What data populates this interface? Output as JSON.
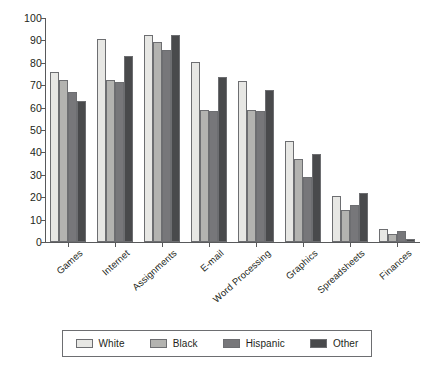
{
  "chart_data": {
    "type": "bar",
    "title": "",
    "subtitle": "",
    "xlabel": "",
    "ylabel": "",
    "ylim": [
      0,
      100
    ],
    "ytick_step": 10,
    "yticks": [
      0,
      10,
      20,
      30,
      40,
      50,
      60,
      70,
      80,
      90,
      100
    ],
    "ytick_labels": [
      "0",
      "10",
      "20",
      "30",
      "40",
      "50",
      "60",
      "70",
      "80",
      "90",
      "100"
    ],
    "grid": false,
    "legend_position": "bottom",
    "orientation": "vertical",
    "categories": [
      "Games",
      "Internet",
      "Assignments",
      "E-mail",
      "Word Processing",
      "Graphics",
      "Spreadsheets",
      "Finances"
    ],
    "series": [
      {
        "name": "White",
        "color": "#e7e7e4",
        "values": [
          76,
          90.5,
          92.5,
          80.5,
          72,
          45,
          20.5,
          6
        ]
      },
      {
        "name": "Black",
        "color": "#b3b3b0",
        "values": [
          72.5,
          72.5,
          89.5,
          59,
          59,
          37,
          14.5,
          3.5
        ]
      },
      {
        "name": "Hispanic",
        "color": "#77777a",
        "values": [
          67,
          71.5,
          85.5,
          58.5,
          58.5,
          29,
          16.5,
          5
        ]
      },
      {
        "name": "Other",
        "color": "#494a4c",
        "values": [
          63,
          83,
          92.5,
          73.5,
          68,
          39.5,
          22,
          1.5
        ]
      }
    ],
    "annotations": [],
    "colors": {
      "axis": "#58595b",
      "bar_outline": "#6d6e71",
      "text": "#231f20",
      "background": "#ffffff"
    }
  },
  "legend": {
    "entries": [
      {
        "label": "White"
      },
      {
        "label": "Black"
      },
      {
        "label": "Hispanic"
      },
      {
        "label": "Other"
      }
    ]
  }
}
